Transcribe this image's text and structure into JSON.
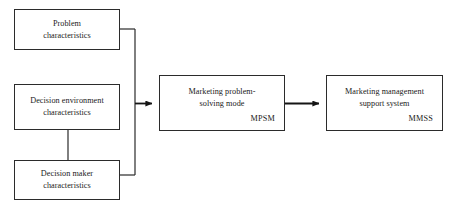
{
  "diagram": {
    "type": "flow-diagram",
    "background_color": "#ffffff",
    "line_color": "#2b2b2b",
    "text_color": "#1a1a1a",
    "nodes": [
      {
        "id": "problem",
        "label": "Problem\ncharacteristics",
        "acronym": "",
        "x": 14,
        "y": 9,
        "width": 106,
        "height": 41
      },
      {
        "id": "environment",
        "label": "Decision environment\ncharacteristics",
        "acronym": "",
        "x": 14,
        "y": 84,
        "width": 106,
        "height": 46
      },
      {
        "id": "maker",
        "label": "Decision maker\ncharacteristics",
        "acronym": "",
        "x": 14,
        "y": 160,
        "width": 106,
        "height": 40
      },
      {
        "id": "mpsm",
        "label": "Marketing problem-\nsolving mode",
        "acronym": "MPSM",
        "x": 159,
        "y": 75,
        "width": 126,
        "height": 56
      },
      {
        "id": "mmss",
        "label": "Marketing management\nsupport system",
        "acronym": "MMSS",
        "x": 326,
        "y": 75,
        "width": 117,
        "height": 56
      }
    ],
    "connectors": [
      {
        "id": "problem-to-trunk",
        "from": "problem",
        "to": "trunk",
        "style": "elbow",
        "arrowhead": false
      },
      {
        "id": "maker-to-trunk",
        "from": "maker",
        "to": "trunk",
        "style": "elbow",
        "arrowhead": false
      },
      {
        "id": "environment-to-maker",
        "from": "environment",
        "to": "maker",
        "style": "straight-vertical",
        "arrowhead": false
      },
      {
        "id": "trunk-to-mpsm",
        "from": "trunk",
        "to": "mpsm",
        "style": "straight-horizontal",
        "arrowhead": true
      },
      {
        "id": "mpsm-to-mmss",
        "from": "mpsm",
        "to": "mmss",
        "style": "straight-horizontal",
        "arrowhead": true
      }
    ]
  }
}
